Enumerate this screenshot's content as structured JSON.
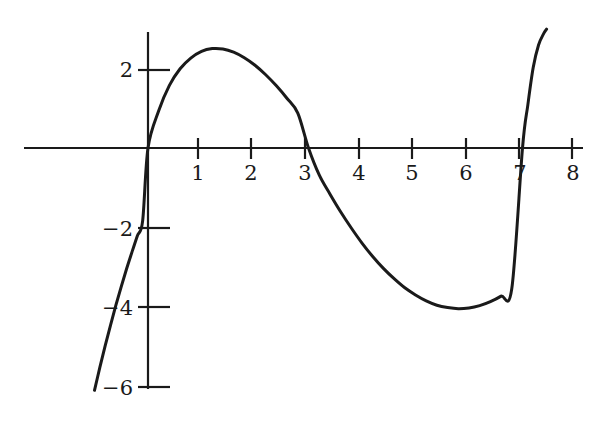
{
  "chart_data": {
    "type": "line",
    "title": "",
    "xlabel": "",
    "ylabel": "",
    "xlim": [
      -1.1,
      8.15
    ],
    "ylim": [
      -6.4,
      2.95
    ],
    "grid": false,
    "legend": null,
    "axis_style": "cartesian-cross",
    "x_axis_tick_values": [
      1,
      2,
      3,
      4,
      5,
      6,
      7,
      8
    ],
    "x_axis_tick_labels": [
      "1",
      "2",
      "3",
      "4",
      "5",
      "6",
      "7",
      "8"
    ],
    "y_axis_tick_values": [
      2,
      -2,
      -4,
      -6
    ],
    "y_axis_tick_labels": [
      "2",
      "−2",
      "−4",
      "−6"
    ],
    "series": [
      {
        "name": "cubic",
        "color": "#1a1a1a",
        "line_width": 3,
        "roots": [
          0,
          3,
          7
        ],
        "local_maximum": {
          "x": 1.2,
          "y": 2.5
        },
        "local_minimum": {
          "x": 5.4,
          "y": -4.15
        },
        "x": [
          -1.0,
          -0.9,
          -0.8,
          -0.7,
          -0.6,
          -0.5,
          -0.4,
          -0.3,
          -0.2,
          -0.1,
          0.0,
          0.2,
          0.4,
          0.6,
          0.8,
          1.0,
          1.2,
          1.4,
          1.6,
          1.8,
          2.0,
          2.2,
          2.4,
          2.6,
          2.8,
          3.0,
          3.2,
          3.4,
          3.6,
          3.8,
          4.0,
          4.2,
          4.4,
          4.6,
          4.8,
          5.0,
          5.2,
          5.4,
          5.6,
          5.8,
          6.0,
          6.2,
          6.4,
          6.6,
          6.8,
          7.0,
          7.1,
          7.2,
          7.3,
          7.4,
          7.45
        ],
        "y": [
          -6.12,
          -5.54,
          -4.99,
          -4.47,
          -3.97,
          -3.5,
          -3.05,
          -2.63,
          -2.22,
          -1.84,
          0.0,
          0.94,
          1.58,
          2.0,
          2.27,
          2.44,
          2.51,
          2.5,
          2.42,
          2.28,
          2.09,
          1.85,
          1.57,
          1.25,
          0.88,
          0.0,
          -0.68,
          -1.16,
          -1.61,
          -2.02,
          -2.4,
          -2.74,
          -3.04,
          -3.3,
          -3.53,
          -3.71,
          -3.86,
          -3.97,
          -4.03,
          -4.06,
          -4.04,
          -3.98,
          -3.88,
          -3.74,
          -3.55,
          0.0,
          1.09,
          2.03,
          2.6,
          2.9,
          3.0
        ]
      }
    ]
  }
}
